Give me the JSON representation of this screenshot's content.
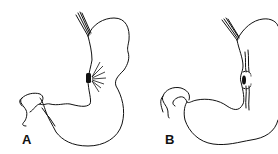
{
  "figure": {
    "panels": [
      {
        "label": "A",
        "depiction": "stomach with ulcer on lesser curvature and radiating mucosal folds"
      },
      {
        "label": "B",
        "depiction": "stomach with converging folds toward ulcer scar on lesser curvature"
      }
    ]
  },
  "colors": {
    "line": "#111111",
    "background": "#ffffff"
  }
}
